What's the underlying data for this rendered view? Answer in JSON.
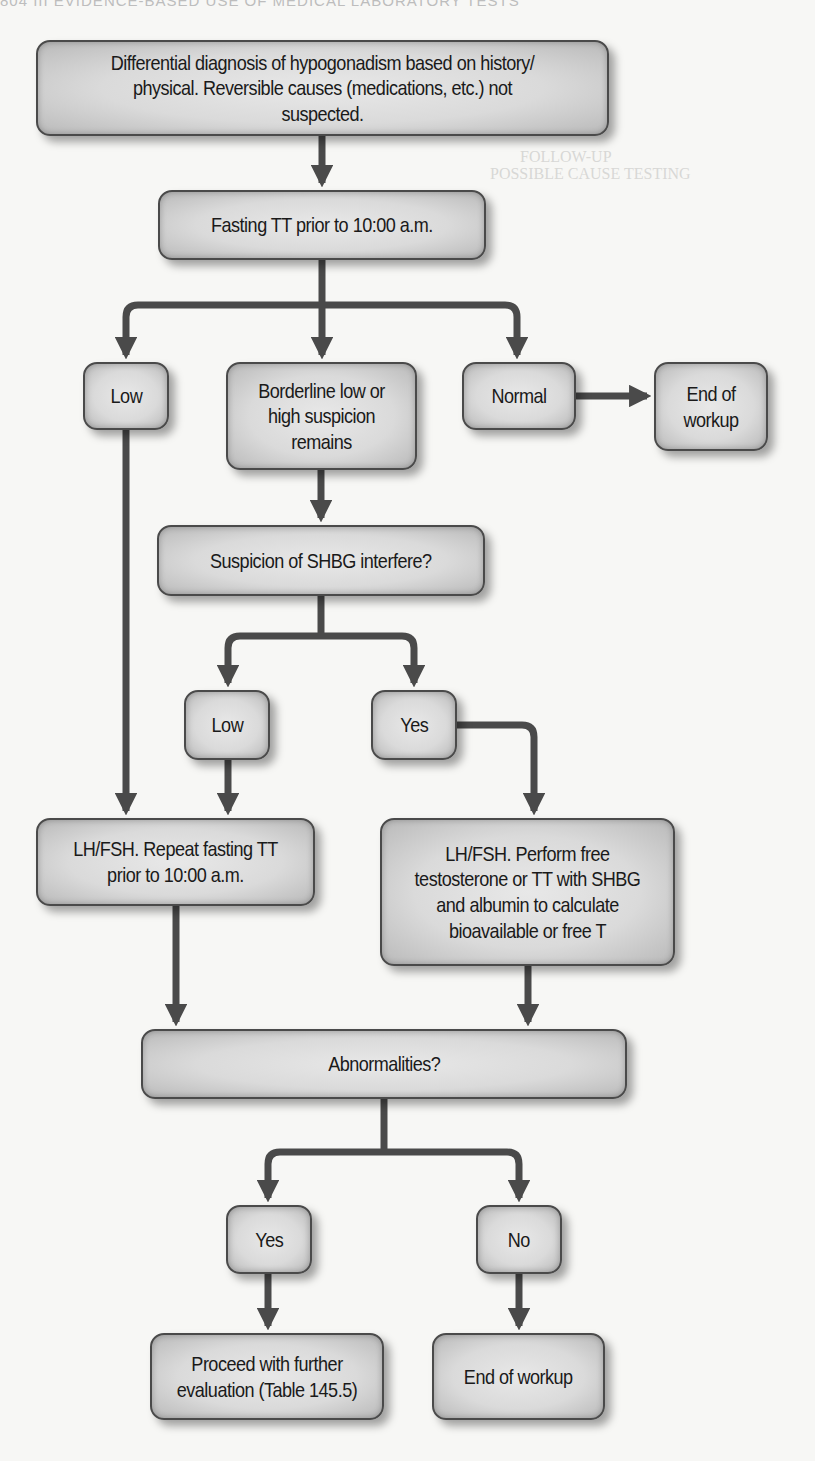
{
  "page": {
    "header_bleed": "804   III  EVIDENCE-BASED USE OF MEDICAL LABORATORY TESTS",
    "bleed_through_text": [
      "FOLLOW-UP",
      "POSSIBLE CAUSE     TESTING",
      "LH     FSH"
    ]
  },
  "flowchart": {
    "nodes": {
      "start": "Differential diagnosis of hypogonadism based on history/ physical. Reversible causes (medications, etc.) not suspected.",
      "fasting_tt": "Fasting TT prior to 10:00 a.m.",
      "low_1": "Low",
      "borderline": "Borderline low or high suspicion remains",
      "normal": "Normal",
      "end_workup_1": "End of workup",
      "shbg": "Suspicion of SHBG interfere?",
      "low_2": "Low",
      "yes_1": "Yes",
      "lh_fsh_repeat": "LH/FSH. Repeat fasting TT prior to 10:00 a.m.",
      "lh_fsh_free": "LH/FSH. Perform free testosterone or TT with SHBG and albumin to calculate bioavailable or free T",
      "abnormalities": "Abnormalities?",
      "yes_2": "Yes",
      "no": "No",
      "proceed": "Proceed with further evaluation (Table 145.5)",
      "end_workup_2": "End of workup"
    },
    "edges": [
      {
        "from": "start",
        "to": "fasting_tt"
      },
      {
        "from": "fasting_tt",
        "to": "low_1"
      },
      {
        "from": "fasting_tt",
        "to": "borderline"
      },
      {
        "from": "fasting_tt",
        "to": "normal"
      },
      {
        "from": "normal",
        "to": "end_workup_1"
      },
      {
        "from": "borderline",
        "to": "shbg"
      },
      {
        "from": "shbg",
        "to": "low_2"
      },
      {
        "from": "shbg",
        "to": "yes_1"
      },
      {
        "from": "low_1",
        "to": "lh_fsh_repeat"
      },
      {
        "from": "low_2",
        "to": "lh_fsh_repeat"
      },
      {
        "from": "yes_1",
        "to": "lh_fsh_free"
      },
      {
        "from": "lh_fsh_repeat",
        "to": "abnormalities"
      },
      {
        "from": "lh_fsh_free",
        "to": "abnormalities"
      },
      {
        "from": "abnormalities",
        "to": "yes_2"
      },
      {
        "from": "abnormalities",
        "to": "no"
      },
      {
        "from": "yes_2",
        "to": "proceed"
      },
      {
        "from": "no",
        "to": "end_workup_2"
      }
    ],
    "colors": {
      "line": "#4a4a4a",
      "node_fill": "#d9d9d9",
      "text": "#1a1a1a"
    }
  }
}
